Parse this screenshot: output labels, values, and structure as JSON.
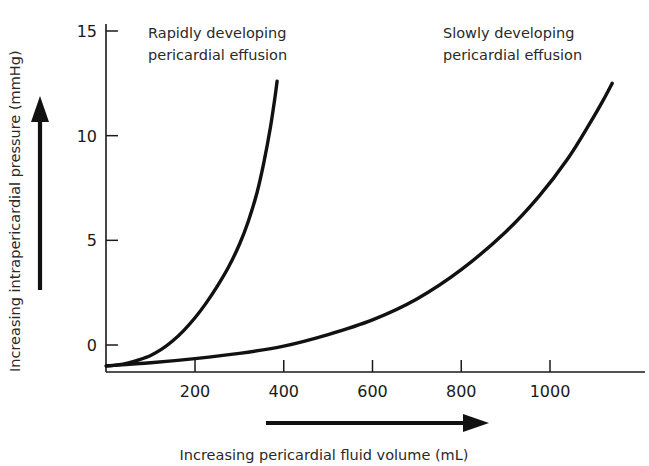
{
  "chart_data": {
    "type": "line",
    "title": "",
    "xlabel": "Increasing pericardial fluid volume (mL)",
    "ylabel": "Increasing intrapericardial pressure (mmHg)",
    "xlim": [
      0,
      1200
    ],
    "ylim": [
      -1.5,
      16
    ],
    "grid": false,
    "legend_position": "inline-annotations",
    "xticks": [
      200,
      400,
      600,
      800,
      1000
    ],
    "xtick_labels": [
      "200",
      "400",
      "600",
      "800",
      "1000"
    ],
    "yticks": [
      0,
      5,
      10,
      15
    ],
    "ytick_labels": [
      "0",
      "5",
      "10",
      "15"
    ],
    "series": [
      {
        "name": "Rapidly developing pericardial effusion",
        "annotation": "Rapidly developing\npericardial effusion",
        "annotation_line1": "Rapidly developing",
        "annotation_line2": "pericardial effusion",
        "color": "#111111",
        "x": [
          0,
          25,
          50,
          75,
          100,
          125,
          150,
          175,
          200,
          225,
          250,
          275,
          300,
          320,
          340,
          355,
          370,
          380,
          385
        ],
        "y": [
          -1.0,
          -0.95,
          -0.85,
          -0.7,
          -0.5,
          -0.2,
          0.2,
          0.7,
          1.3,
          2.0,
          2.8,
          3.7,
          4.8,
          5.9,
          7.3,
          8.7,
          10.4,
          11.8,
          12.6
        ]
      },
      {
        "name": "Slowly developing pericardial effusion",
        "annotation": "Slowly developing\npericardial effusion",
        "annotation_line1": "Slowly developing",
        "annotation_line2": "pericardial effusion",
        "color": "#111111",
        "x": [
          0,
          100,
          200,
          300,
          400,
          500,
          600,
          700,
          800,
          900,
          975,
          1040,
          1090,
          1120,
          1140
        ],
        "y": [
          -1.0,
          -0.85,
          -0.65,
          -0.4,
          -0.05,
          0.5,
          1.2,
          2.2,
          3.6,
          5.4,
          7.1,
          8.9,
          10.6,
          11.7,
          12.5
        ]
      }
    ]
  },
  "axes": {
    "y_arrow_label": "upward-direction-arrow",
    "x_arrow_label": "rightward-direction-arrow"
  }
}
